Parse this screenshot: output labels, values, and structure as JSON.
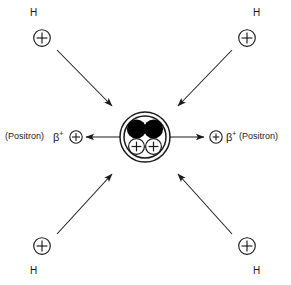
{
  "diagram": {
    "colors": {
      "stroke": "#1a1a1a",
      "fill": "#000000",
      "background": "#ffffff"
    },
    "nucleus": {
      "name": "helium-nucleus",
      "neutrons": [
        {
          "name": "neutron-left",
          "label": ""
        },
        {
          "name": "neutron-right",
          "label": ""
        }
      ],
      "protons": [
        {
          "name": "proton-left",
          "label": "+"
        },
        {
          "name": "proton-right",
          "label": "+"
        }
      ]
    },
    "reactants": [
      {
        "id": "h-top-left",
        "element": "H",
        "charge": "+",
        "corner": "top-left"
      },
      {
        "id": "h-top-right",
        "element": "H",
        "charge": "+",
        "corner": "top-right"
      },
      {
        "id": "h-bottom-left",
        "element": "H",
        "charge": "+",
        "corner": "bottom-left"
      },
      {
        "id": "h-bottom-right",
        "element": "H",
        "charge": "+",
        "corner": "bottom-right"
      }
    ],
    "emissions": [
      {
        "id": "positron-left",
        "name": "(Positron)",
        "symbol": "β",
        "superscript": "+",
        "charge": "+",
        "direction": "left"
      },
      {
        "id": "positron-right",
        "name": "(Positron)",
        "symbol": "β",
        "superscript": "+",
        "charge": "+",
        "direction": "right"
      }
    ]
  }
}
